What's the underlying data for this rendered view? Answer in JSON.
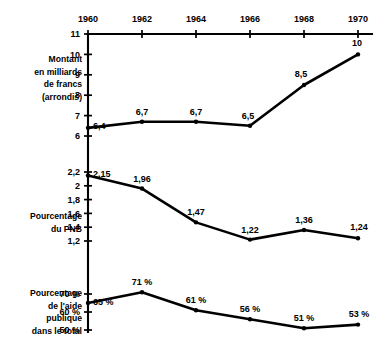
{
  "chart_data": {
    "type": "line",
    "title": "",
    "xlabel": "",
    "categories": [
      "1960",
      "1962",
      "1964",
      "1966",
      "1968",
      "1970"
    ],
    "x": [
      1960,
      1962,
      1964,
      1966,
      1968,
      1970
    ],
    "grid": false,
    "legend": "none",
    "panels": [
      {
        "id": "montant",
        "caption_lines": [
          "Montant",
          "en milliards",
          "de francs",
          "(arrondis)"
        ],
        "ylabel": "Montant en milliards de francs (arrondis)",
        "ylim": [
          6,
          11
        ],
        "yticks": [
          "11",
          "10",
          "9",
          "8",
          "7",
          "6"
        ],
        "ytick_values": [
          11,
          10,
          9,
          8,
          7,
          6
        ],
        "values": [
          6.4,
          6.7,
          6.7,
          6.5,
          8.5,
          10
        ],
        "point_labels": [
          "6,4",
          "6,7",
          "6,7",
          "6,5",
          "8,5",
          "10"
        ]
      },
      {
        "id": "pourcentage-pnb",
        "caption_lines": [
          "Pourcentage",
          "du PNB"
        ],
        "ylabel": "Pourcentage du PNB",
        "ylim": [
          1.2,
          2.2
        ],
        "yticks": [
          "2,2",
          "2",
          "1,8",
          "1,6",
          "1,4",
          "1,2"
        ],
        "ytick_values": [
          2.2,
          2.0,
          1.8,
          1.6,
          1.4,
          1.2
        ],
        "values": [
          2.15,
          1.96,
          1.47,
          1.22,
          1.36,
          1.24
        ],
        "point_labels": [
          "2,15",
          "1,96",
          "1,47",
          "1,22",
          "1,36",
          "1,24"
        ]
      },
      {
        "id": "pourcentage-aide-publique",
        "caption_lines": [
          "Pourcentage",
          "de l'aide",
          "publique",
          "dans le total"
        ],
        "ylabel": "Pourcentage de l'aide publique dans le total",
        "ylim": [
          50,
          70
        ],
        "yticks": [
          "70 %",
          "60 %",
          "50 %"
        ],
        "ytick_values": [
          70,
          60,
          50
        ],
        "values": [
          65,
          71,
          61,
          56,
          51,
          53
        ],
        "point_labels": [
          "65 %",
          "71 %",
          "61 %",
          "56 %",
          "51 %",
          "53 %"
        ]
      }
    ],
    "colors": {
      "line": "#000000",
      "axis": "#000000",
      "background": "#ffffff",
      "text": "#000000"
    }
  }
}
